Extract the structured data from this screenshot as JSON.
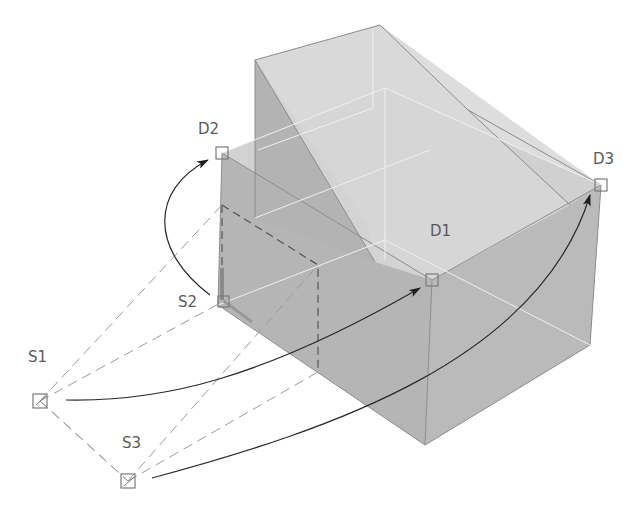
{
  "diagram": {
    "type": "3d-alignment",
    "colors": {
      "background": "#ffffff",
      "face_top": "#d4d4d4",
      "face_top_upper": "#d9d9d9",
      "face_left": "#b9b9b9",
      "face_front": "#b0b0b0",
      "face_right": "#bdbdbd",
      "edge_highlight": "#f2f2f2",
      "dashed": "#9a9a9a",
      "arrow": "#2a2a2a",
      "label": "#5a5a5a"
    },
    "labels": {
      "S1": "S1",
      "S2": "S2",
      "S3": "S3",
      "D1": "D1",
      "D2": "D2",
      "D3": "D3"
    },
    "points": {
      "S1": [
        40,
        401
      ],
      "S2": [
        224,
        301
      ],
      "S3": [
        128,
        481
      ],
      "D1": [
        432,
        280
      ],
      "D2": [
        222,
        153
      ],
      "D3": [
        601,
        185
      ]
    },
    "mappings": [
      {
        "from": "S1",
        "to": "D1"
      },
      {
        "from": "S2",
        "to": "D2"
      },
      {
        "from": "S3",
        "to": "D3"
      }
    ]
  }
}
